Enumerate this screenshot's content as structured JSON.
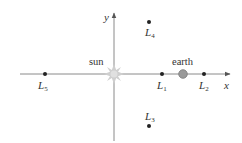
{
  "diagram": {
    "type": "lagrange-points",
    "axes": {
      "x_label": "x",
      "y_label": "y"
    },
    "bodies": {
      "sun": {
        "label": "sun",
        "color": "#c8c8c8"
      },
      "earth": {
        "label": "earth",
        "color": "#9a9a9a"
      }
    },
    "points": [
      {
        "id": "L1",
        "letter": "L",
        "sub": "1"
      },
      {
        "id": "L2",
        "letter": "L",
        "sub": "2"
      },
      {
        "id": "L3",
        "letter": "L",
        "sub": "3"
      },
      {
        "id": "L4",
        "letter": "L",
        "sub": "4"
      },
      {
        "id": "L5",
        "letter": "L",
        "sub": "5"
      }
    ],
    "colors": {
      "axis": "#777777",
      "point": "#222222",
      "text": "#333333"
    }
  }
}
